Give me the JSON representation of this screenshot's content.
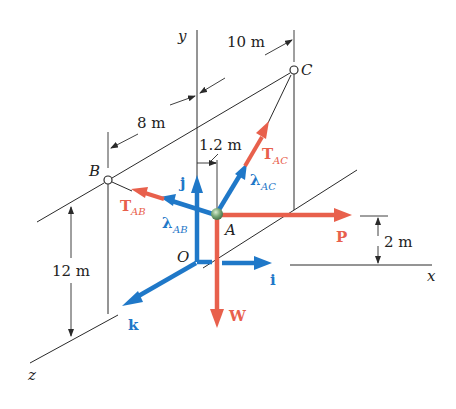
{
  "figure": {
    "type": "3D statics free-body diagram",
    "axes": {
      "x": "x",
      "y": "y",
      "z": "z",
      "origin": "O"
    },
    "points": {
      "A": "A",
      "B": "B",
      "C": "C",
      "O": "O"
    },
    "unit_vectors": {
      "i": "i",
      "j": "j",
      "k": "k",
      "lambda_AB": {
        "symbol": "λ",
        "sub": "AB"
      },
      "lambda_AC": {
        "symbol": "λ",
        "sub": "AC"
      }
    },
    "forces": {
      "T_AB": {
        "symbol": "T",
        "sub": "AB"
      },
      "T_AC": {
        "symbol": "T",
        "sub": "AC"
      },
      "P": "P",
      "W": "W"
    },
    "dimensions": {
      "d_10": "10 m",
      "d_8": "8 m",
      "d_1_2": "1.2 m",
      "d_12": "12 m",
      "d_2": "2 m"
    },
    "colors": {
      "force": "#e8604c",
      "unit_vector": "#1f78c8",
      "line": "#2a2a2a",
      "particle": "#6a9a6a"
    }
  }
}
